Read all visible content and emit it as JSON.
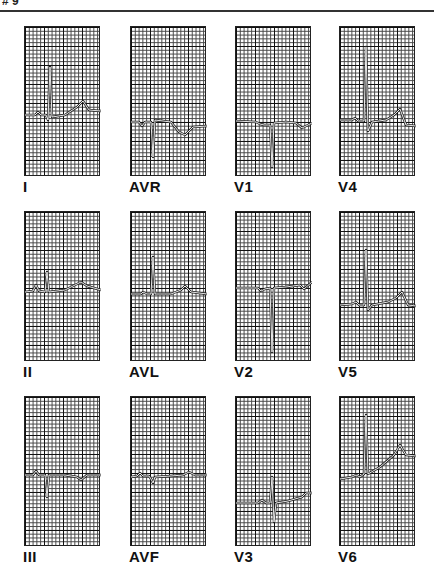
{
  "header": {
    "page_number": "# 9"
  },
  "figure": {
    "colors": {
      "grid": "#222222",
      "trace": "#ffffff",
      "trace_outline": "#222222"
    },
    "leads": [
      {
        "label": "I",
        "row": 0,
        "col": 0,
        "baseline_pct": 58,
        "trace": "M0,88 L10,88 L13,85 L16,88 L21,88 L23,93 L25,40 L27,90 L40,88 L52,80 L58,74 L64,83 L76,84"
      },
      {
        "label": "AVR",
        "row": 0,
        "col": 1,
        "baseline_pct": 62,
        "trace": "M0,95 L8,95 L11,99 L14,95 L20,95 L22,130 L24,93 L40,95 L48,105 L54,108 L62,100 L76,99"
      },
      {
        "label": "V1",
        "row": 0,
        "col": 2,
        "baseline_pct": 65,
        "trace": "M0,94 L20,95 L24,97 L28,98 L34,98 L36,140 L38,96 L50,95 L60,96 L66,101 L76,96"
      },
      {
        "label": "V4",
        "row": 0,
        "col": 3,
        "baseline_pct": 60,
        "trace": "M0,93 L12,93 L15,91 L18,94 L24,94 L26,20 L28,104 L32,95 L46,93 L54,88 L60,82 L66,98 L76,99"
      },
      {
        "label": "II",
        "row": 1,
        "col": 0,
        "baseline_pct": 52,
        "trace": "M0,80 L8,79 L11,73 L14,79 L20,80 L22,60 L24,80 L40,78 L50,73 L56,70 L62,74 L76,78"
      },
      {
        "label": "AVL",
        "row": 1,
        "col": 1,
        "baseline_pct": 55,
        "trace": "M0,82 L10,82 L12,80 L16,82 L20,82 L22,45 L24,82 L40,82 L50,78 L54,74 L60,80 L76,82"
      },
      {
        "label": "V2",
        "row": 1,
        "col": 2,
        "baseline_pct": 50,
        "trace": "M0,76 L22,76 L25,79 L29,77 L34,76 L36,140 L38,76 L50,75 L64,73 L68,77 L76,70"
      },
      {
        "label": "V5",
        "row": 1,
        "col": 3,
        "baseline_pct": 62,
        "trace": "M0,93 L12,92 L16,90 L19,93 L24,93 L26,38 L28,98 L32,93 L48,90 L56,86 L62,80 L68,93 L76,94"
      },
      {
        "label": "III",
        "row": 2,
        "col": 0,
        "baseline_pct": 52,
        "trace": "M0,78 L8,78 L11,74 L14,78 L20,78 L22,100 L24,78 L40,78 L52,80 L56,83 L62,78 L76,78"
      },
      {
        "label": "AVF",
        "row": 2,
        "col": 1,
        "baseline_pct": 52,
        "trace": "M0,80 L6,79 L9,76 L12,79 L18,79 L20,82 L22,86 L24,80 L40,79 L52,78 L58,75 L64,78 L76,78"
      },
      {
        "label": "V3",
        "row": 2,
        "col": 2,
        "baseline_pct": 72,
        "trace": "M0,106 L22,106 L26,103 L30,106 L34,106 L36,80 L38,125 L40,106 L52,104 L66,100 L70,96 L76,96"
      },
      {
        "label": "V6",
        "row": 2,
        "col": 3,
        "baseline_pct": 55,
        "trace": "M0,82 L12,80 L16,78 L20,80 L24,77 L26,18 L28,77 L40,70 L54,58 L60,48 L66,58 L76,59"
      }
    ]
  }
}
